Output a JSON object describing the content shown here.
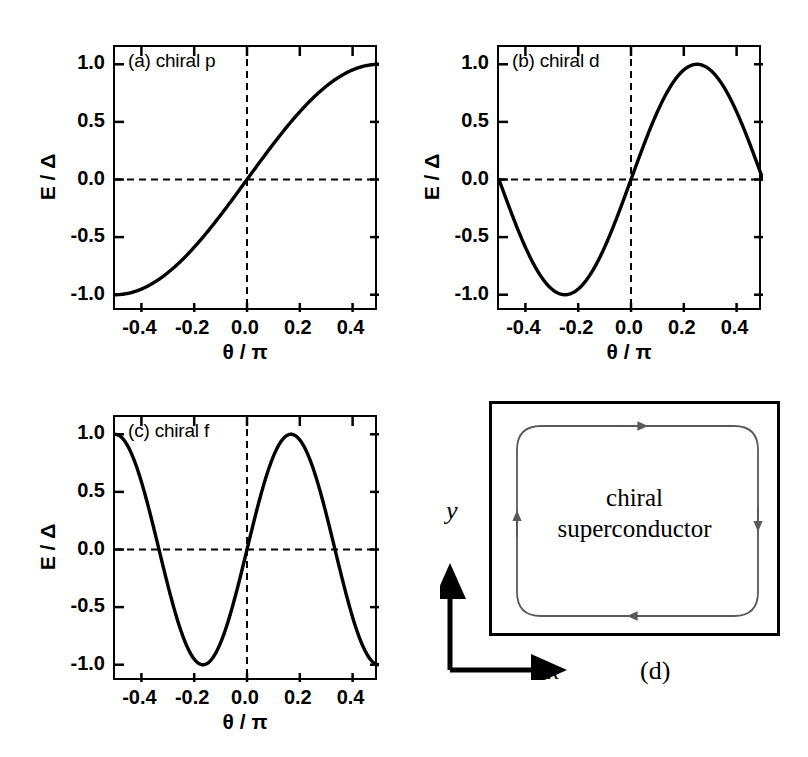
{
  "figure": {
    "background": "#ffffff",
    "curve_color": "#000000",
    "dashed_color": "#000000",
    "arrow_color": "#595959"
  },
  "panels": {
    "a": {
      "label": "(a) chiral p",
      "xlabel": "θ / π",
      "ylabel": "E / Δ",
      "xticks": [
        "-0.4",
        "-0.2",
        "0.0",
        "0.2",
        "0.4"
      ],
      "yticks": [
        "1.0",
        "0.5",
        "0.0",
        "-0.5",
        "-1.0"
      ]
    },
    "b": {
      "label": "(b) chiral d",
      "xlabel": "θ / π",
      "ylabel": "E / Δ",
      "xticks": [
        "-0.4",
        "-0.2",
        "0.0",
        "0.2",
        "0.4"
      ],
      "yticks": [
        "1.0",
        "0.5",
        "0.0",
        "-0.5",
        "-1.0"
      ]
    },
    "c": {
      "label": "(c) chiral f",
      "xlabel": "θ / π",
      "ylabel": "E / Δ",
      "xticks": [
        "-0.4",
        "-0.2",
        "0.0",
        "0.2",
        "0.4"
      ],
      "yticks": [
        "1.0",
        "0.5",
        "0.0",
        "-0.5",
        "-1.0"
      ]
    },
    "d": {
      "label": "(d)",
      "body_line1": "chiral",
      "body_line2": "superconductor",
      "x_axis_label": "x",
      "y_axis_label": "y"
    }
  },
  "chart_data": [
    {
      "type": "line",
      "panel": "a",
      "title": "(a) chiral p",
      "xlabel": "θ / π",
      "ylabel": "E / Δ",
      "xlim": [
        -0.5,
        0.5
      ],
      "ylim": [
        -1.15,
        1.15
      ],
      "xticks": [
        -0.4,
        -0.2,
        0.0,
        0.2,
        0.4
      ],
      "yticks": [
        1.0,
        0.5,
        0.0,
        -0.5,
        -1.0
      ],
      "grid": false,
      "legend": "none",
      "formula": "E/Δ = sin(π * x)",
      "harmonic": 1,
      "branches": [
        {
          "x_start": -0.5,
          "x_end": 0.5,
          "zero_crossing": 0.0,
          "y_at_start": -1.0,
          "y_at_end": 1.0
        }
      ],
      "annotations": [
        {
          "text": "zero energy crossing at θ/π = 0.0"
        }
      ]
    },
    {
      "type": "line",
      "panel": "b",
      "title": "(b) chiral d",
      "xlabel": "θ / π",
      "ylabel": "E / Δ",
      "xlim": [
        -0.5,
        0.5
      ],
      "ylim": [
        -1.15,
        1.15
      ],
      "xticks": [
        -0.4,
        -0.2,
        0.0,
        0.2,
        0.4
      ],
      "yticks": [
        1.0,
        0.5,
        0.0,
        -0.5,
        -1.0
      ],
      "grid": false,
      "legend": "none",
      "formula": "E/Δ = sin(2π * x)",
      "harmonic": 2,
      "branches": [
        {
          "x_start": -0.5,
          "x_end": 0.0,
          "zero_crossing": -0.25,
          "y_at_start": -1.0,
          "y_at_end": 1.0
        },
        {
          "x_start": 0.0,
          "x_end": 0.5,
          "zero_crossing": 0.25,
          "y_at_start": -1.0,
          "y_at_end": 1.0
        }
      ],
      "annotations": [
        {
          "text": "discontinuity at θ/π = 0.0"
        }
      ]
    },
    {
      "type": "line",
      "panel": "c",
      "title": "(c) chiral f",
      "xlabel": "θ / π",
      "ylabel": "E / Δ",
      "xlim": [
        -0.5,
        0.5
      ],
      "ylim": [
        -1.15,
        1.15
      ],
      "xticks": [
        -0.4,
        -0.2,
        0.0,
        0.2,
        0.4
      ],
      "yticks": [
        1.0,
        0.5,
        0.0,
        -0.5,
        -1.0
      ],
      "grid": false,
      "legend": "none",
      "formula": "E/Δ = sin(3π * x)",
      "harmonic": 3,
      "branches": [
        {
          "x_start": -0.5,
          "x_end": -0.16667,
          "zero_crossing": -0.33333,
          "y_at_start": -1.0,
          "y_at_end": 1.0
        },
        {
          "x_start": -0.16667,
          "x_end": 0.16667,
          "zero_crossing": 0.0,
          "y_at_start": -1.0,
          "y_at_end": 1.0
        },
        {
          "x_start": 0.16667,
          "x_end": 0.5,
          "zero_crossing": 0.33333,
          "y_at_start": -1.0,
          "y_at_end": 1.0
        }
      ],
      "annotations": [
        {
          "text": "discontinuities at θ/π = ±0.1667"
        }
      ]
    },
    {
      "type": "diagram",
      "panel": "d",
      "title": "(d)",
      "body": "chiral superconductor",
      "axes": [
        "x",
        "y"
      ],
      "current_direction": "clockwise",
      "edge_arrows": [
        "top-right",
        "right-down",
        "bottom-left",
        "left-up"
      ]
    }
  ]
}
